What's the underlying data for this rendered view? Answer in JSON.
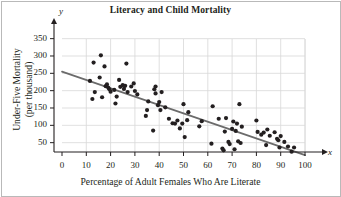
{
  "figure": {
    "title": "Literacy and Child Mortality",
    "x_axis_title": "Percentage of Adult Females Who Are Literate",
    "y_axis_title_line1": "Under-Five Mortality",
    "y_axis_title_line2": "(per thousand)",
    "x_axis_variable": "x",
    "y_axis_variable": "y"
  },
  "colors": {
    "point": "#231f20",
    "trendline": "#6b6b6b",
    "grid": "#d8d8d8",
    "axis": "#231f20",
    "border": "#b9b9b9",
    "background": "#ffffff"
  },
  "chart_data": {
    "type": "scatter",
    "title": "Literacy and Child Mortality",
    "xlabel": "Percentage of Adult Females Who Are Literate",
    "ylabel": "Under-Five Mortality (per thousand)",
    "xlim": [
      0,
      100
    ],
    "ylim": [
      0,
      360
    ],
    "xticks": [
      0,
      10,
      20,
      30,
      40,
      50,
      60,
      70,
      80,
      90,
      100
    ],
    "yticks": [
      50,
      100,
      150,
      200,
      250,
      300,
      350
    ],
    "xtick_labels": [
      "0",
      "10",
      "20",
      "30",
      "40",
      "50",
      "60",
      "70",
      "80",
      "90",
      "100"
    ],
    "ytick_labels": [
      "50",
      "100",
      "150",
      "200",
      "250",
      "300",
      "350"
    ],
    "grid": true,
    "legend": "none",
    "series": [
      {
        "name": "Countries",
        "marker": "filled-circle",
        "points": [
          [
            11.5,
            228
          ],
          [
            12.5,
            176
          ],
          [
            13.0,
            281
          ],
          [
            13.5,
            196
          ],
          [
            15.5,
            238
          ],
          [
            16.0,
            302
          ],
          [
            16.5,
            181
          ],
          [
            17.5,
            270
          ],
          [
            18.0,
            213
          ],
          [
            18.5,
            218
          ],
          [
            19.0,
            209
          ],
          [
            19.5,
            204
          ],
          [
            20.0,
            197
          ],
          [
            21.5,
            202
          ],
          [
            22.0,
            163
          ],
          [
            22.5,
            183
          ],
          [
            23.5,
            231
          ],
          [
            24.0,
            211
          ],
          [
            25.0,
            216
          ],
          [
            25.5,
            205
          ],
          [
            26.0,
            214
          ],
          [
            26.5,
            278
          ],
          [
            27.0,
            196
          ],
          [
            28.5,
            212
          ],
          [
            29.5,
            221
          ],
          [
            30.0,
            199
          ],
          [
            31.0,
            189
          ],
          [
            34.5,
            127
          ],
          [
            35.0,
            144
          ],
          [
            35.5,
            169
          ],
          [
            37.5,
            85
          ],
          [
            38.0,
            204
          ],
          [
            38.5,
            192
          ],
          [
            38.5,
            212
          ],
          [
            39.5,
            158
          ],
          [
            40.0,
            167
          ],
          [
            40.5,
            144
          ],
          [
            41.0,
            196
          ],
          [
            42.5,
            152
          ],
          [
            44.0,
            119
          ],
          [
            45.5,
            106
          ],
          [
            46.5,
            105
          ],
          [
            47.5,
            114
          ],
          [
            48.5,
            91
          ],
          [
            49.5,
            105
          ],
          [
            50.0,
            161
          ],
          [
            50.5,
            66
          ],
          [
            51.5,
            115
          ],
          [
            52.0,
            138
          ],
          [
            56.5,
            97
          ],
          [
            57.5,
            112
          ],
          [
            61.5,
            47
          ],
          [
            62.0,
            155
          ],
          [
            64.5,
            119
          ],
          [
            66.0,
            33
          ],
          [
            66.5,
            28
          ],
          [
            67.0,
            82
          ],
          [
            67.5,
            121
          ],
          [
            68.5,
            52
          ],
          [
            69.0,
            46
          ],
          [
            70.0,
            90
          ],
          [
            70.5,
            111
          ],
          [
            71.0,
            31
          ],
          [
            71.5,
            84
          ],
          [
            72.0,
            105
          ],
          [
            72.5,
            54
          ],
          [
            73.0,
            161
          ],
          [
            73.5,
            49
          ],
          [
            74.0,
            96
          ],
          [
            80.0,
            114
          ],
          [
            80.5,
            81
          ],
          [
            82.0,
            73
          ],
          [
            83.0,
            79
          ],
          [
            84.0,
            43
          ],
          [
            84.5,
            88
          ],
          [
            85.5,
            70
          ],
          [
            87.5,
            80
          ],
          [
            88.5,
            61
          ],
          [
            89.0,
            57
          ],
          [
            89.5,
            36
          ],
          [
            90.0,
            69
          ],
          [
            91.5,
            52
          ],
          [
            93.0,
            39
          ],
          [
            94.5,
            24
          ],
          [
            95.5,
            36
          ]
        ]
      }
    ],
    "trendline": {
      "type": "linear",
      "x_start": 0,
      "y_start": 255,
      "x_end": 100,
      "y_end": 14,
      "color": "#6b6b6b"
    }
  }
}
